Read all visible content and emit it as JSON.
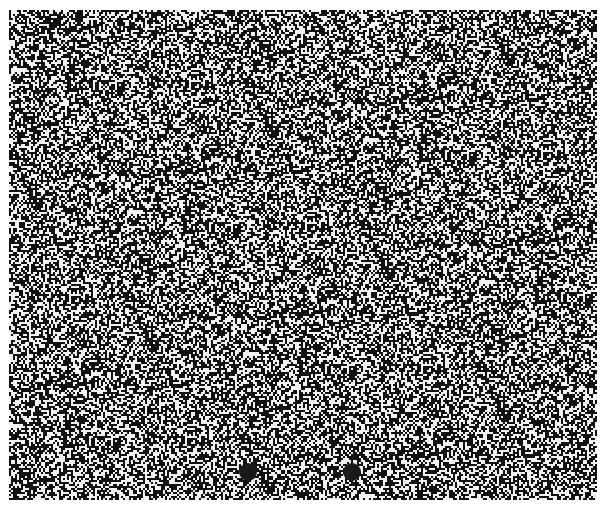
{
  "image": {
    "kind": "random-dot stereogram",
    "width": 606,
    "height": 514,
    "background": "#ffffff",
    "field": {
      "x": 9,
      "y": 10,
      "width": 588,
      "height": 490
    },
    "dot_colors": {
      "dark": "#111111",
      "light": "#f2f2f2"
    },
    "dark_density": 0.55,
    "pixel_size": 2,
    "fixation_dots": [
      {
        "cx": 248,
        "cy": 472,
        "diameter": 18,
        "color": "#1a1a1a"
      },
      {
        "cx": 352,
        "cy": 472,
        "diameter": 18,
        "color": "#1a1a1a"
      }
    ]
  }
}
